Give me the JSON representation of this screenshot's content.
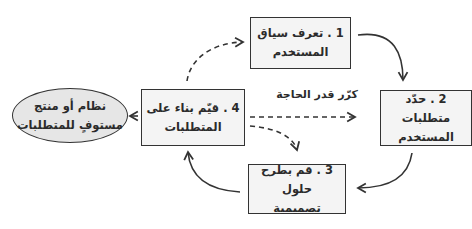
{
  "diagram": {
    "type": "cycle-flow",
    "colors": {
      "box_fill": "#f4f4f4",
      "ellipse_fill": "#e6e6e6",
      "stroke": "#333333",
      "text": "#2b2b2b"
    },
    "steps": [
      {
        "id": 1,
        "line1": "1 . تعرف سياق",
        "line2": "المستخدم"
      },
      {
        "id": 2,
        "line1": "2 . حدّد متطلبات",
        "line2": "المستخدم"
      },
      {
        "id": 3,
        "line1": "3 . قم بطرح حلول",
        "line2": "تصميمية"
      },
      {
        "id": 4,
        "line1": "4 . قيّم بناء على",
        "line2": "المتطلبات"
      }
    ],
    "outcome": {
      "line1": "نظام أو منتج",
      "line2": "مستوفٍ للمتطلبات"
    },
    "loop_label": "كرّر قدر الحاجة",
    "connections": [
      {
        "from": "step-1",
        "to": "step-2",
        "style": "solid"
      },
      {
        "from": "step-2",
        "to": "step-3",
        "style": "solid"
      },
      {
        "from": "step-3",
        "to": "step-4",
        "style": "solid"
      },
      {
        "from": "step-4",
        "to": "outcome",
        "style": "solid"
      },
      {
        "from": "step-4",
        "to": "step-1",
        "style": "dashed"
      },
      {
        "from": "step-4",
        "to": "step-2",
        "style": "dashed"
      },
      {
        "from": "step-4",
        "to": "step-3",
        "style": "dashed"
      }
    ]
  }
}
